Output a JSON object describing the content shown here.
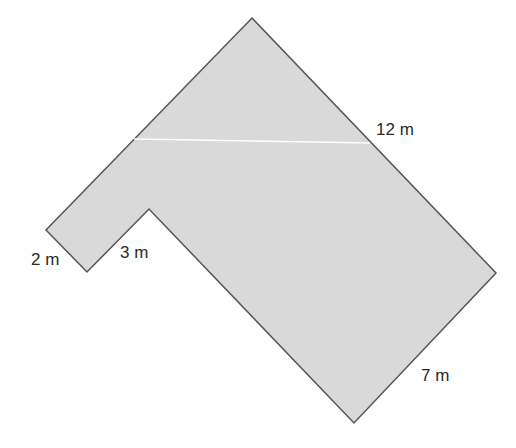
{
  "diagram": {
    "type": "composite-shape",
    "fill_color": "#d9d9d9",
    "stroke_color": "#555555",
    "divider_color": "#ffffff",
    "vertices": [
      [
        252,
        18
      ],
      [
        496,
        273
      ],
      [
        354,
        423
      ],
      [
        149,
        209
      ],
      [
        87,
        272
      ],
      [
        46,
        230
      ]
    ],
    "divider_line": [
      [
        134,
        139
      ],
      [
        370,
        143
      ]
    ],
    "labels": {
      "top_right": "12 m",
      "bottom_right": "7 m",
      "notch_inner": "3 m",
      "left_end": "2 m"
    }
  }
}
